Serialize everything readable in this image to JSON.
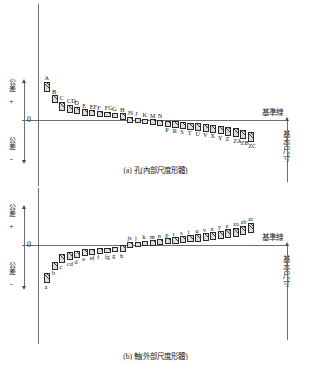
{
  "figure": {
    "datum_label": "基準線",
    "basic_size_label": "基本尺寸",
    "axis_positive_label": "公差",
    "axis_negative_label": "公差",
    "plus_sign": "+",
    "minus_sign": "-",
    "zero_label": "0"
  },
  "chart_data": [
    {
      "type": "bar",
      "id": "a",
      "title": "(a) 孔(內部尺度形體)",
      "ylabel": "公差",
      "xlabel": "",
      "datum_line": "基準線",
      "basic_size": "基本尺寸",
      "note": "Hole (internal feature of size) tolerance zones. Bar spans are deviations in arbitrary units relative to the zero (datum) line; positive above, negative below.",
      "categories": [
        "A",
        "B",
        "C",
        "CD",
        "D",
        "E",
        "EF",
        "F",
        "FG",
        "G",
        "H",
        "JS",
        "J",
        "K",
        "M",
        "N",
        "P",
        "R",
        "S",
        "T",
        "U",
        "V",
        "X",
        "Y",
        "Z",
        "ZA",
        "ZB",
        "ZC"
      ],
      "bars": [
        {
          "label": "A",
          "top": 110,
          "bottom": 82
        },
        {
          "label": "B",
          "top": 72,
          "bottom": 48
        },
        {
          "label": "C",
          "top": 52,
          "bottom": 26
        },
        {
          "label": "CD",
          "top": 44,
          "bottom": 21
        },
        {
          "label": "D",
          "top": 38,
          "bottom": 17
        },
        {
          "label": "E",
          "top": 31,
          "bottom": 13
        },
        {
          "label": "EF",
          "top": 28,
          "bottom": 11
        },
        {
          "label": "F",
          "top": 25,
          "bottom": 9
        },
        {
          "label": "FG",
          "top": 23,
          "bottom": 8
        },
        {
          "label": "G",
          "top": 21,
          "bottom": 7
        },
        {
          "label": "H",
          "top": 20,
          "bottom": 0
        },
        {
          "label": "JS",
          "top": 10,
          "bottom": -10
        },
        {
          "label": "J",
          "top": 6,
          "bottom": -9
        },
        {
          "label": "K",
          "top": 3,
          "bottom": -13
        },
        {
          "label": "M",
          "top": 2,
          "bottom": -14
        },
        {
          "label": "N",
          "top": 1,
          "bottom": -16
        },
        {
          "label": "P",
          "top": -2,
          "bottom": -19
        },
        {
          "label": "R",
          "top": -4,
          "bottom": -22
        },
        {
          "label": "S",
          "top": -6,
          "bottom": -25
        },
        {
          "label": "T",
          "top": -8,
          "bottom": -28
        },
        {
          "label": "U",
          "top": -10,
          "bottom": -31
        },
        {
          "label": "V",
          "top": -12,
          "bottom": -34
        },
        {
          "label": "X",
          "top": -14,
          "bottom": -37
        },
        {
          "label": "Y",
          "top": -17,
          "bottom": -41
        },
        {
          "label": "Z",
          "top": -20,
          "bottom": -45
        },
        {
          "label": "ZA",
          "top": -23,
          "bottom": -49
        },
        {
          "label": "ZB",
          "top": -28,
          "bottom": -56
        },
        {
          "label": "ZC",
          "top": -34,
          "bottom": -64
        }
      ]
    },
    {
      "type": "bar",
      "id": "b",
      "title": "(b) 軸(外部尺度形體)",
      "ylabel": "公差",
      "xlabel": "",
      "datum_line": "基準線",
      "basic_size": "基本尺寸",
      "note": "Shaft (external feature of size) tolerance zones, mirror of the hole chart.",
      "categories": [
        "a",
        "b",
        "c",
        "cd",
        "d",
        "e",
        "ef",
        "f",
        "fg",
        "g",
        "h",
        "js",
        "j",
        "k",
        "m",
        "n",
        "p",
        "r",
        "s",
        "t",
        "u",
        "v",
        "x",
        "y",
        "z",
        "za",
        "zb",
        "zc"
      ],
      "bars": [
        {
          "label": "a",
          "top": -82,
          "bottom": -110
        },
        {
          "label": "b",
          "top": -48,
          "bottom": -72
        },
        {
          "label": "c",
          "top": -26,
          "bottom": -52
        },
        {
          "label": "cd",
          "top": -21,
          "bottom": -44
        },
        {
          "label": "d",
          "top": -17,
          "bottom": -38
        },
        {
          "label": "e",
          "top": -13,
          "bottom": -31
        },
        {
          "label": "ef",
          "top": -11,
          "bottom": -28
        },
        {
          "label": "f",
          "top": -9,
          "bottom": -25
        },
        {
          "label": "fg",
          "top": -8,
          "bottom": -23
        },
        {
          "label": "g",
          "top": -7,
          "bottom": -21
        },
        {
          "label": "h",
          "top": 0,
          "bottom": -20
        },
        {
          "label": "js",
          "top": 10,
          "bottom": -10
        },
        {
          "label": "j",
          "top": 9,
          "bottom": -6
        },
        {
          "label": "k",
          "top": 13,
          "bottom": -3
        },
        {
          "label": "m",
          "top": 14,
          "bottom": -2
        },
        {
          "label": "n",
          "top": 16,
          "bottom": -1
        },
        {
          "label": "p",
          "top": 19,
          "bottom": 2
        },
        {
          "label": "r",
          "top": 22,
          "bottom": 4
        },
        {
          "label": "s",
          "top": 25,
          "bottom": 6
        },
        {
          "label": "t",
          "top": 28,
          "bottom": 8
        },
        {
          "label": "u",
          "top": 31,
          "bottom": 10
        },
        {
          "label": "v",
          "top": 34,
          "bottom": 12
        },
        {
          "label": "x",
          "top": 37,
          "bottom": 14
        },
        {
          "label": "y",
          "top": 41,
          "bottom": 17
        },
        {
          "label": "z",
          "top": 45,
          "bottom": 20
        },
        {
          "label": "za",
          "top": 49,
          "bottom": 23
        },
        {
          "label": "zb",
          "top": 56,
          "bottom": 28
        },
        {
          "label": "zc",
          "top": 64,
          "bottom": 34
        }
      ]
    }
  ]
}
